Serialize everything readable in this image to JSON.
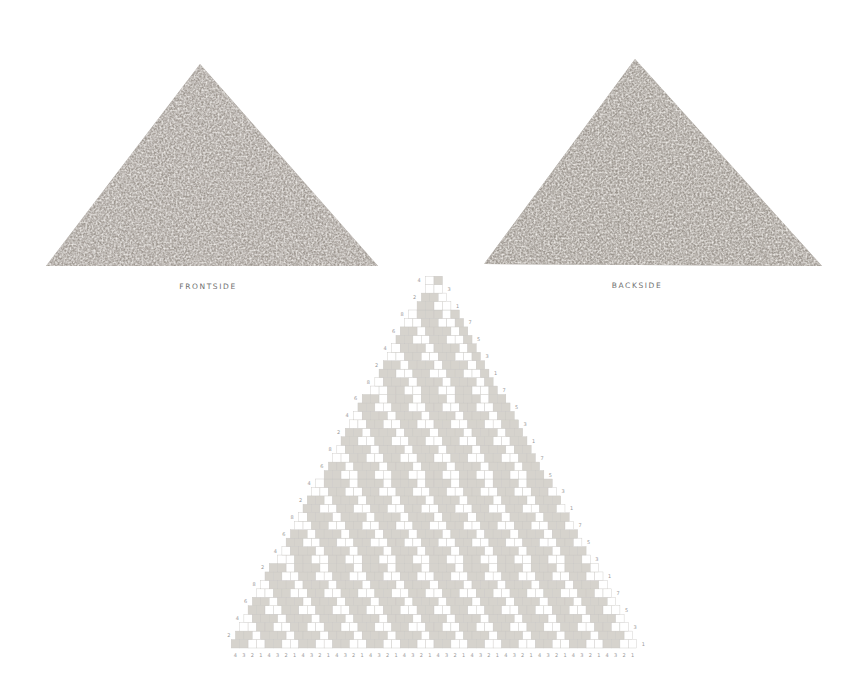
{
  "captions": {
    "front": "FRONTSIDE",
    "back": "BACKSIDE"
  },
  "colors": {
    "fabric_base": "#a39d97",
    "fabric_light": "#c9c4be",
    "fabric_dark": "#7e7872",
    "cell_filled": "#d6d3cd",
    "cell_empty": "#ffffff",
    "grid_line": "#c8c6c2",
    "numbers": "#9a9a9a"
  },
  "chart": {
    "rows": 44,
    "cell": 8.45,
    "apex_x": 434,
    "bottom_y": 648,
    "row_label_cycle_left": [
      "2",
      "4",
      "6",
      "8"
    ],
    "row_label_cycle_right": [
      "1",
      "3",
      "5",
      "7"
    ],
    "bottom_labels": [
      "4",
      "3",
      "2",
      "1",
      "4",
      "3",
      "2",
      "1",
      "4",
      "3",
      "2",
      "1",
      "4",
      "3",
      "2",
      "1",
      "4",
      "3",
      "2",
      "1",
      "4",
      "3",
      "2",
      "1",
      "4",
      "3",
      "2",
      "1",
      "4",
      "3",
      "2",
      "1",
      "4",
      "3",
      "2",
      "1",
      "4",
      "3",
      "2",
      "1",
      "4",
      "3",
      "2",
      "1",
      "4",
      "3",
      "2",
      "1"
    ]
  }
}
